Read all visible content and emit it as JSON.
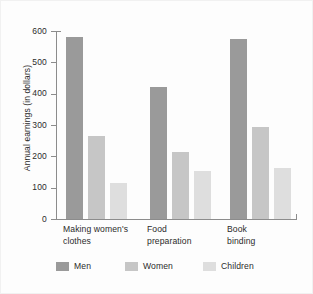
{
  "chart_data": {
    "type": "bar",
    "title": "",
    "subtitle": "",
    "xlabel": "",
    "ylabel": "Annual earnings (in dollars)",
    "ylim": [
      0,
      600
    ],
    "yticks": [
      0,
      100,
      200,
      300,
      400,
      500,
      600
    ],
    "ytick_labels": [
      "0",
      "100",
      "200",
      "300",
      "400",
      "500",
      "600"
    ],
    "grid": false,
    "legend_position": "bottom",
    "categories": [
      "Making women's clothes",
      "Food preparation",
      "Book binding"
    ],
    "series": [
      {
        "name": "Men",
        "color": "#9a9a9a",
        "values": [
          580,
          420,
          573
        ]
      },
      {
        "name": "Women",
        "color": "#c6c6c6",
        "values": [
          265,
          215,
          295
        ]
      },
      {
        "name": "Children",
        "color": "#dedede",
        "values": [
          115,
          152,
          163
        ]
      }
    ]
  },
  "axes": {
    "y_title": "Annual earnings (in dollars)",
    "y_ticks": [
      {
        "label": "600",
        "value": 600
      },
      {
        "label": "500",
        "value": 500
      },
      {
        "label": "400",
        "value": 400
      },
      {
        "label": "300",
        "value": 300
      },
      {
        "label": "200",
        "value": 200
      },
      {
        "label": "100",
        "value": 100
      },
      {
        "label": "0",
        "value": 0
      }
    ],
    "x_groups": [
      {
        "label": "Making women's\nclothes"
      },
      {
        "label": "Food\npreparation"
      },
      {
        "label": "Book\nbinding"
      }
    ]
  },
  "legend": {
    "items": [
      {
        "label": "Men",
        "color": "#9a9a9a"
      },
      {
        "label": "Women",
        "color": "#c6c6c6"
      },
      {
        "label": "Children",
        "color": "#dedede"
      }
    ]
  },
  "colors": {
    "men": "#9a9a9a",
    "women": "#c6c6c6",
    "children": "#dedede",
    "axis": "#8c8c8c",
    "text": "#2b2b2b",
    "background": "#fdfdfd"
  }
}
